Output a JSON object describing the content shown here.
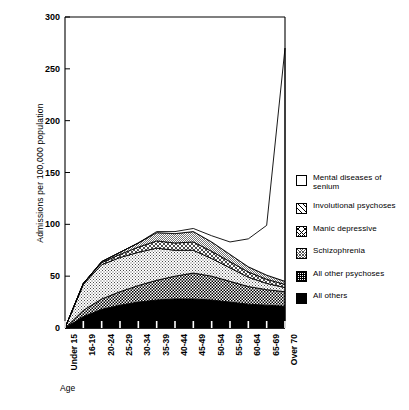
{
  "chart_data": {
    "type": "area",
    "stacked": true,
    "title": "",
    "subtitle": "",
    "xlabel": "Age",
    "ylabel": "Admissions per 100,000 population",
    "ylim": [
      0,
      300
    ],
    "yticks": [
      0,
      50,
      100,
      150,
      200,
      250,
      300
    ],
    "grid": false,
    "legend_position": "right",
    "categories": [
      "Under 15",
      "16-19",
      "20-24",
      "25-29",
      "30-34",
      "35-39",
      "40-44",
      "45-49",
      "50-54",
      "55-59",
      "60-64",
      "65-69",
      "Over 70"
    ],
    "series": [
      {
        "name": "All others",
        "pattern": "solid-black",
        "color": "#000000",
        "values": [
          0,
          11,
          18,
          22,
          25,
          27,
          28,
          28,
          27,
          25,
          23,
          22,
          21
        ]
      },
      {
        "name": "All other psychoses",
        "pattern": "checkered",
        "color": "#8a8a8a",
        "values": [
          0,
          6,
          10,
          13,
          16,
          19,
          22,
          25,
          23,
          20,
          17,
          15,
          14
        ]
      },
      {
        "name": "Schizophrenia",
        "pattern": "light-stipple",
        "color": "#c9c9c9",
        "values": [
          0,
          25,
          33,
          33,
          32,
          31,
          25,
          22,
          17,
          13,
          9,
          6,
          4
        ]
      },
      {
        "name": "Manic depressive",
        "pattern": "cross-hatch",
        "color": "#b0b0b0",
        "values": [
          0,
          1,
          2,
          3,
          5,
          7,
          7,
          8,
          7,
          6,
          5,
          4,
          3
        ]
      },
      {
        "name": "Involutional psychoses",
        "pattern": "diagonal-lines",
        "color": "#dcdcdc",
        "values": [
          0,
          0,
          1,
          2,
          4,
          8,
          9,
          10,
          9,
          7,
          5,
          4,
          3
        ]
      },
      {
        "name": "Mental diseases of senium",
        "pattern": "white",
        "color": "#ffffff",
        "values": [
          0,
          0,
          0,
          0,
          0,
          1,
          2,
          3,
          6,
          12,
          27,
          48,
          225
        ]
      }
    ],
    "series_totals": [
      0,
      43,
      64,
      73,
      82,
      93,
      93,
      96,
      89,
      83,
      86,
      99,
      270
    ],
    "annotations": []
  },
  "legend": {
    "items": [
      {
        "label": "Mental diseases of senium",
        "swatch": "white"
      },
      {
        "label": "Involutional psychoses",
        "swatch": "diagonal-lines"
      },
      {
        "label": "Manic depressive",
        "swatch": "cross-hatch"
      },
      {
        "label": "Schizophrenia",
        "swatch": "light-stipple"
      },
      {
        "label": "All other psychoses",
        "swatch": "checkered"
      },
      {
        "label": "All others",
        "swatch": "solid-black"
      }
    ]
  }
}
